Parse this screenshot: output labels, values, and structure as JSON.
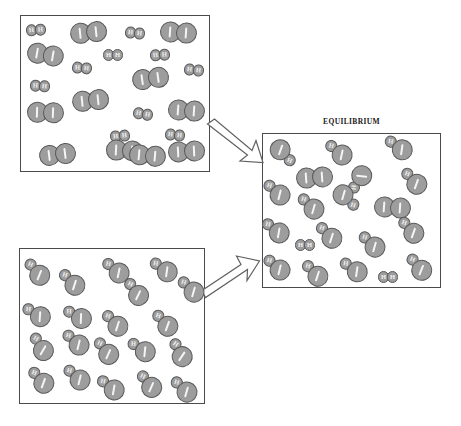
{
  "figure": {
    "title_visible": false,
    "equilibrium_label": "EQUILIBRIUM",
    "width": 461,
    "height": 426,
    "background_color": "#ffffff"
  },
  "style": {
    "atom_fill": "#9d9d9d",
    "atom_stroke": "#595959",
    "marking_color": "#f4f4f4",
    "box_stroke": "#4a4a4a",
    "arrow_fill": "#ffffff",
    "arrow_stroke": "#616161"
  },
  "legend_keys": {
    "large_atom_symbol": "I",
    "small_atom_symbol": "H",
    "large_atom_mark": "tick"
  },
  "chart_data": {
    "type": "scatter",
    "xlabel": "",
    "ylabel": "",
    "grid": false,
    "legend_position": "none",
    "panels": [
      {
        "id": "reactants-top",
        "label": "",
        "box": {
          "x": 20,
          "y": 15,
          "width": 190,
          "height": 157
        },
        "species_counts": {
          "I2": 12,
          "H2": 12,
          "HI": 0
        },
        "molecules": [
          {
            "type": "H2",
            "x": 36,
            "y": 30,
            "rot": -4
          },
          {
            "type": "I2",
            "x": 88,
            "y": 32,
            "rot": -6
          },
          {
            "type": "H2",
            "x": 135,
            "y": 33,
            "rot": 6
          },
          {
            "type": "I2",
            "x": 178,
            "y": 32,
            "rot": 4
          },
          {
            "type": "I2",
            "x": 45,
            "y": 54,
            "rot": 10
          },
          {
            "type": "H2",
            "x": 113,
            "y": 55,
            "rot": 0
          },
          {
            "type": "H2",
            "x": 160,
            "y": 55,
            "rot": -4
          },
          {
            "type": "H2",
            "x": 82,
            "y": 68,
            "rot": 5
          },
          {
            "type": "H2",
            "x": 194,
            "y": 70,
            "rot": 6
          },
          {
            "type": "I2",
            "x": 150,
            "y": 78,
            "rot": -8
          },
          {
            "type": "H2",
            "x": 40,
            "y": 86,
            "rot": 4
          },
          {
            "type": "I2",
            "x": 90,
            "y": 100,
            "rot": -6
          },
          {
            "type": "I2",
            "x": 45,
            "y": 112,
            "rot": 2
          },
          {
            "type": "I2",
            "x": 186,
            "y": 110,
            "rot": 4
          },
          {
            "type": "H2",
            "x": 143,
            "y": 114,
            "rot": 10
          },
          {
            "type": "H2",
            "x": 120,
            "y": 136,
            "rot": -5
          },
          {
            "type": "H2",
            "x": 175,
            "y": 135,
            "rot": 6
          },
          {
            "type": "I2",
            "x": 57,
            "y": 154,
            "rot": -7
          },
          {
            "type": "I2",
            "x": 124,
            "y": 150,
            "rot": 3
          },
          {
            "type": "I2",
            "x": 147,
            "y": 155,
            "rot": 5
          },
          {
            "type": "I2",
            "x": 186,
            "y": 151,
            "rot": -3
          }
        ]
      },
      {
        "id": "reactants-bottom",
        "label": "",
        "box": {
          "x": 19,
          "y": 248,
          "width": 186,
          "height": 156
        },
        "species_counts": {
          "I2": 0,
          "H2": 0,
          "HI": 24
        },
        "molecules": [
          {
            "type": "HI",
            "x": 38,
            "y": 273,
            "rot": 22
          },
          {
            "type": "HI",
            "x": 73,
            "y": 283,
            "rot": 18
          },
          {
            "type": "HI",
            "x": 117,
            "y": 271,
            "rot": 12
          },
          {
            "type": "HI",
            "x": 165,
            "y": 270,
            "rot": 8
          },
          {
            "type": "HI",
            "x": 137,
            "y": 293,
            "rot": 26
          },
          {
            "type": "HI",
            "x": 192,
            "y": 290,
            "rot": 16
          },
          {
            "type": "HI",
            "x": 38,
            "y": 315,
            "rot": 4
          },
          {
            "type": "HI",
            "x": 79,
            "y": 317,
            "rot": 2
          },
          {
            "type": "HI",
            "x": 116,
            "y": 324,
            "rot": 18
          },
          {
            "type": "HI",
            "x": 166,
            "y": 324,
            "rot": 20
          },
          {
            "type": "HI",
            "x": 42,
            "y": 348,
            "rot": 30
          },
          {
            "type": "HI",
            "x": 77,
            "y": 343,
            "rot": 14
          },
          {
            "type": "HI",
            "x": 107,
            "y": 352,
            "rot": 24
          },
          {
            "type": "HI",
            "x": 143,
            "y": 350,
            "rot": 6
          },
          {
            "type": "HI",
            "x": 181,
            "y": 354,
            "rot": 34
          },
          {
            "type": "HI",
            "x": 42,
            "y": 381,
            "rot": 20
          },
          {
            "type": "HI",
            "x": 78,
            "y": 378,
            "rot": 14
          },
          {
            "type": "HI",
            "x": 112,
            "y": 388,
            "rot": 10
          },
          {
            "type": "HI",
            "x": 150,
            "y": 385,
            "rot": 24
          },
          {
            "type": "HI",
            "x": 185,
            "y": 390,
            "rot": 16
          }
        ]
      },
      {
        "id": "equilibrium",
        "label": "EQUILIBRIUM",
        "box": {
          "x": 262,
          "y": 133,
          "width": 179,
          "height": 155
        },
        "species_counts": {
          "I2": 2,
          "H2": 2,
          "HI": 18
        },
        "molecules": [
          {
            "type": "HI",
            "x": 282,
            "y": 152,
            "rot": 200
          },
          {
            "type": "HI",
            "x": 340,
            "y": 153,
            "rot": 12
          },
          {
            "type": "HI",
            "x": 400,
            "y": 148,
            "rot": 8
          },
          {
            "type": "I2",
            "x": 314,
            "y": 177,
            "rot": -4
          },
          {
            "type": "HI",
            "x": 360,
            "y": 178,
            "rot": -84
          },
          {
            "type": "HI",
            "x": 415,
            "y": 182,
            "rot": 20
          },
          {
            "type": "HI",
            "x": 278,
            "y": 193,
            "rot": 14
          },
          {
            "type": "HI",
            "x": 312,
            "y": 207,
            "rot": 16
          },
          {
            "type": "HI",
            "x": 345,
            "y": 197,
            "rot": 196
          },
          {
            "type": "I2",
            "x": 392,
            "y": 207,
            "rot": 4
          },
          {
            "type": "HI",
            "x": 277,
            "y": 231,
            "rot": 10
          },
          {
            "type": "HI",
            "x": 330,
            "y": 236,
            "rot": 18
          },
          {
            "type": "HI",
            "x": 412,
            "y": 231,
            "rot": 20
          },
          {
            "type": "H2",
            "x": 305,
            "y": 245,
            "rot": 0
          },
          {
            "type": "HI",
            "x": 373,
            "y": 245,
            "rot": 16
          },
          {
            "type": "HI",
            "x": 278,
            "y": 268,
            "rot": 14
          },
          {
            "type": "HI",
            "x": 316,
            "y": 274,
            "rot": 18
          },
          {
            "type": "HI",
            "x": 355,
            "y": 270,
            "rot": 8
          },
          {
            "type": "H2",
            "x": 388,
            "y": 277,
            "rot": 0
          },
          {
            "type": "HI",
            "x": 420,
            "y": 268,
            "rot": 22
          }
        ]
      }
    ],
    "arrows": [
      {
        "id": "arrow-top",
        "from_panel": "reactants-top",
        "to_panel": "equilibrium",
        "direction": "down-right"
      },
      {
        "id": "arrow-bottom",
        "from_panel": "reactants-bottom",
        "to_panel": "equilibrium",
        "direction": "up-right"
      }
    ]
  }
}
